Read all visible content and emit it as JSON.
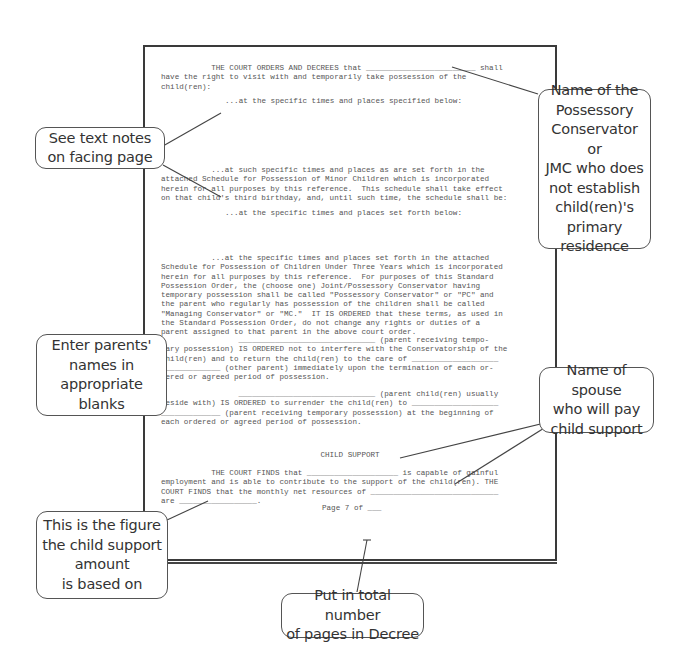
{
  "document": {
    "para1_l1": "           THE COURT ORDERS AND DECREES that ________________________ shall",
    "para1_l2": "have the right to visit with and temporarily take possession of the",
    "para1_l3": "child(ren):",
    "opt1": "...at the specific times and places specified below:",
    "opt2_l1": "           ...at such specific times and places as are set forth in the",
    "opt2_l2": "attached Schedule for Possession of Minor Children which is incorporated",
    "opt2_l3": "herein for all purposes by this reference.  This schedule shall take effect",
    "opt2_l4": "on that child's third birthday, and, until such time, the schedule shall be:",
    "opt3": "...at the specific times and places set forth below:",
    "opt4_l1": "           ...at the specific times and places set forth in the attached",
    "opt4_l2": "Schedule for Possession of Children Under Three Years which is incorporated",
    "opt4_l3": "herein for all purposes by this reference.  For purposes of this Standard",
    "opt4_l4": "Possession Order, the (choose one) Joint/Possessory Conservator having",
    "opt4_l5": "temporary possession shall be called \"Possessory Conservator\" or \"PC\" and",
    "opt4_l6": "the parent who regularly has possession of the children shall be called",
    "opt4_l7": "\"Managing Conservator\" or \"MC.\"  IT IS ORDERED that these terms, as used in",
    "opt4_l8": "the Standard Possession Order, do not change any rights or duties of a",
    "opt4_l9": "parent assigned to that parent in the above court order.",
    "p5_l1": "                 ______________________________ (parent receiving tempo-",
    "p5_l2": "rary possession) IS ORDERED not to interfere with the Conservatorship of the",
    "p5_l3": "child(ren) and to return the child(ren) to the care of ___________________",
    "p5_l4": "_____________ (other parent) immediately upon the termination of each or-",
    "p5_l5": "dered or agreed period of possession.",
    "p6_l1": "                 ______________________________ (parent child(ren) usually",
    "p6_l2": "reside with) IS ORDERED to surrender the child(ren) to ___________________",
    "p6_l3": "_____________ (parent receiving temporary possession) at the beginning of",
    "p6_l4": "each ordered or agreed period of possession.",
    "section_title": "CHILD SUPPORT",
    "cs_l1": "           THE COURT FINDS that ____________________ is capable of gainful",
    "cs_l2": "employment and is able to contribute to the support of the child(ren). THE",
    "cs_l3": "COURT FINDS that the monthly net resources of ____________________________",
    "cs_l4": "are _________________.",
    "footer": "Page 7 of ___"
  },
  "callouts": {
    "possessory_conservator": "Name of the\nPossessory\nConservator or\nJMC who does\nnot establish\nchild(ren)'s\nprimary\nresidence",
    "text_notes": "See text notes\non facing page",
    "parents_names": "Enter parents'\nnames in\nappropriate\nblanks",
    "spouse_pay": "Name of spouse\nwho will pay\nchild support",
    "figure_based": "This is the figure\nthe child support\namount\nis based on",
    "total_pages": "Put in total number\nof pages in Decree"
  },
  "colors": {
    "border": "#3a3a3a",
    "text": "#555555",
    "callout_text": "#333333"
  }
}
